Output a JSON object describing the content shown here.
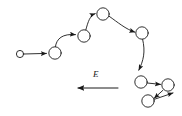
{
  "figure": {
    "type": "diagram",
    "title": "",
    "background_color": "#ffffff",
    "stroke_color": "#1a1a1a",
    "width": 182,
    "height": 116,
    "field": {
      "label": "E",
      "description": "electric field direction arrow pointing left",
      "arrow": {
        "x1": 118,
        "y1": 88,
        "x2": 72,
        "y2": 88,
        "direction": "left"
      },
      "label_position": {
        "x": 95,
        "y": 74
      }
    },
    "nodes": [
      {
        "id": "n1",
        "label": "",
        "cx": 20,
        "cy": 54,
        "r": 3.6,
        "name": "small-circle-start"
      },
      {
        "id": "n2",
        "label": "",
        "cx": 55,
        "cy": 53,
        "r": 6.2,
        "name": "circle-2"
      },
      {
        "id": "n3",
        "label": "",
        "cx": 84,
        "cy": 36,
        "r": 6.2,
        "name": "circle-3"
      },
      {
        "id": "n4",
        "label": "",
        "cx": 103,
        "cy": 14,
        "r": 6.2,
        "name": "circle-4"
      },
      {
        "id": "n5",
        "label": "",
        "cx": 142,
        "cy": 33,
        "r": 6.2,
        "name": "circle-5"
      },
      {
        "id": "n6",
        "label": "",
        "cx": 141,
        "cy": 82,
        "r": 6.2,
        "name": "circle-6"
      },
      {
        "id": "n7",
        "label": "",
        "cx": 168,
        "cy": 85,
        "r": 6.2,
        "name": "circle-7"
      },
      {
        "id": "n8",
        "label": "",
        "cx": 148,
        "cy": 101,
        "r": 6.2,
        "name": "circle-8"
      }
    ],
    "edges": [
      {
        "from": "n1",
        "to": "n2",
        "kind": "straight-arrow",
        "name": "edge-1-2"
      },
      {
        "from": "n2",
        "to": "n3",
        "kind": "curved-arrow",
        "name": "edge-2-3"
      },
      {
        "from": "n3",
        "to": "n4",
        "kind": "curved-arrow",
        "name": "edge-3-4"
      },
      {
        "from": "n4",
        "to": "n5",
        "kind": "curved-arrow",
        "name": "edge-4-5"
      },
      {
        "from": "n5",
        "to": "n6",
        "kind": "curved-arrow",
        "name": "edge-5-6"
      },
      {
        "from": "n6",
        "to": "n7",
        "kind": "straight-arrow",
        "name": "edge-6-7"
      },
      {
        "from": "n7",
        "to": "n8",
        "kind": "straight-arrow",
        "name": "edge-7-8"
      },
      {
        "from": "n8",
        "to": "n7",
        "kind": "straight-arrow",
        "name": "edge-8-7"
      }
    ]
  }
}
